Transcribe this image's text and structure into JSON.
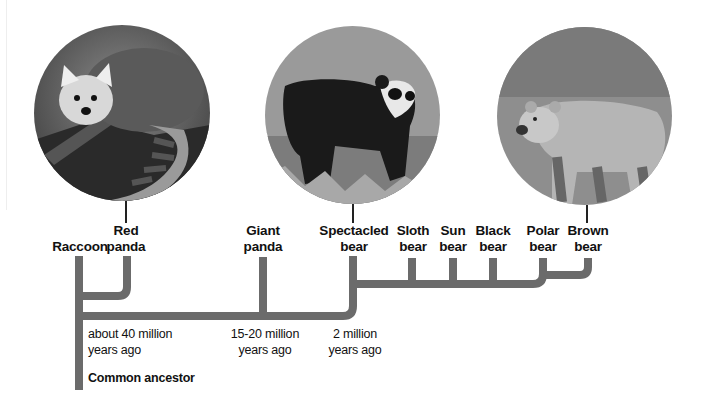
{
  "diagram": {
    "type": "phylogenetic-tree",
    "line_color": "#6b6b6b",
    "photos": [
      {
        "id": "red-panda",
        "subject": "Red panda on a log"
      },
      {
        "id": "spectacled-bear",
        "subject": "Spectacled bear in grass"
      },
      {
        "id": "brown-bear",
        "subject": "Brown bear in tall grass"
      }
    ],
    "taxa": [
      {
        "id": "raccoon",
        "line1": "Raccoon",
        "line2": ""
      },
      {
        "id": "red-panda",
        "line1": "Red",
        "line2": "panda"
      },
      {
        "id": "giant-panda",
        "line1": "Giant",
        "line2": "panda"
      },
      {
        "id": "spectacled-bear",
        "line1": "Spectacled",
        "line2": "bear"
      },
      {
        "id": "sloth-bear",
        "line1": "Sloth",
        "line2": "bear"
      },
      {
        "id": "sun-bear",
        "line1": "Sun",
        "line2": "bear"
      },
      {
        "id": "black-bear",
        "line1": "Black",
        "line2": "bear"
      },
      {
        "id": "polar-bear",
        "line1": "Polar",
        "line2": "bear"
      },
      {
        "id": "brown-bear",
        "line1": "Brown",
        "line2": "bear"
      }
    ],
    "divergence_times": [
      {
        "line1": "about 40 million",
        "line2": "years ago"
      },
      {
        "line1": "15-20 million",
        "line2": "years ago"
      },
      {
        "line1": "2 million",
        "line2": "years ago"
      }
    ],
    "root_label": "Common ancestor"
  }
}
